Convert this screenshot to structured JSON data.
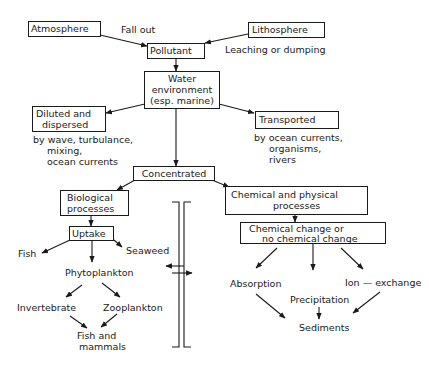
{
  "diagram": {
    "nodes": {
      "atmosphere": "Atmosphere",
      "lithosphere": "Lithosphere",
      "pollutant": "Pollutant",
      "water_environment": [
        "Water",
        "environment",
        "(esp. marine)"
      ],
      "diluted": [
        "Diluted and",
        "dispersed"
      ],
      "transported": "Transported",
      "concentrated": "Concentrated",
      "biological": [
        "Biological",
        "processes"
      ],
      "uptake": "Uptake",
      "chemical_physical": [
        "Chemical and physical",
        "processes"
      ],
      "chemical_change": [
        "Chemical change or",
        "no chemical change"
      ]
    },
    "labels": {
      "fall_out": "Fall out",
      "leaching": "Leaching or dumping",
      "diluted_by": [
        "by wave, turbulance,",
        "mixing,",
        "ocean currents"
      ],
      "transported_by": [
        "by ocean currents,",
        "organisms,",
        "rivers"
      ],
      "fish": "Fish",
      "seaweed": "Seaweed",
      "phytoplankton": "Phytoplankton",
      "invertebrate": "Invertebrate",
      "zooplankton": "Zooplankton",
      "fish_mammals": [
        "Fish and",
        "mammals"
      ],
      "absorption": "Absorption",
      "precipitation": "Precipitation",
      "ion_exchange": "Ion — exchange",
      "sediments": "Sediments"
    },
    "colors": {
      "ink": "#1a1a1a",
      "background": "#ffffff"
    }
  }
}
